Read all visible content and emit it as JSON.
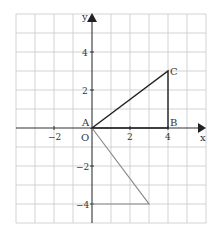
{
  "figure": {
    "axes": {
      "x_label": "x",
      "y_label": "y",
      "origin_label": "O",
      "x_ticks": [
        {
          "value": -2,
          "label": "−2"
        },
        {
          "value": 2,
          "label": "2"
        },
        {
          "value": 4,
          "label": "4"
        }
      ],
      "y_ticks": [
        {
          "value": 4,
          "label": "4"
        },
        {
          "value": 2,
          "label": "2"
        },
        {
          "value": -2,
          "label": "−2"
        },
        {
          "value": -4,
          "label": "−4"
        }
      ],
      "x_range": [
        -4,
        6
      ],
      "y_range": [
        -5,
        6
      ]
    },
    "points": {
      "A": {
        "label": "A",
        "x": 0,
        "y": 0
      },
      "B": {
        "label": "B",
        "x": 4,
        "y": 0
      },
      "C": {
        "label": "C",
        "x": 4,
        "y": 3
      }
    },
    "shapes": [
      {
        "name": "triangle-ABC",
        "vertices": [
          [
            0,
            0
          ],
          [
            4,
            0
          ],
          [
            4,
            3
          ]
        ],
        "color": "#222222"
      },
      {
        "name": "image-triangle",
        "vertices": [
          [
            0,
            0
          ],
          [
            3,
            -4
          ],
          [
            0,
            -4
          ]
        ],
        "color": "#8a8a8a"
      }
    ],
    "colors": {
      "grid": "#c8c8c8",
      "axis": "#333333",
      "triangle": "#222222",
      "image_triangle": "#8a8a8a"
    }
  }
}
